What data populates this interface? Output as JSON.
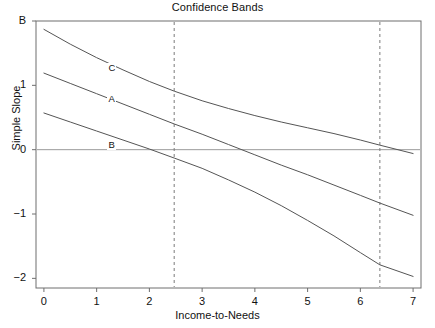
{
  "chart_data": {
    "type": "line",
    "title": "Confidence Bands",
    "xlabel": "Income-to-Needs",
    "ylabel": "Simple Slope",
    "xlim": [
      -0.15,
      7.15
    ],
    "ylim": [
      -2.15,
      2.0
    ],
    "grid": false,
    "legend": "inline-labels",
    "xticks": [
      0,
      1,
      2,
      3,
      4,
      5,
      6,
      7
    ],
    "xtick_labels": [
      "0",
      "1",
      "2",
      "3",
      "4",
      "5",
      "6",
      "7"
    ],
    "yticks": [
      2,
      1,
      0,
      -1,
      -2
    ],
    "ytick_labels": [
      "B",
      "1",
      "0",
      "−1",
      "−2"
    ],
    "zero_reference_line": 0,
    "vlines": [
      2.47,
      6.37
    ],
    "series": [
      {
        "name": "C",
        "role": "upper-confidence-band",
        "label": "C",
        "label_at": {
          "x": 1.28,
          "y": 1.27
        },
        "x": [
          0,
          0.5,
          1,
          1.5,
          2,
          2.47,
          3,
          3.5,
          4,
          4.5,
          5,
          5.5,
          6,
          6.37,
          7
        ],
        "y": [
          1.87,
          1.64,
          1.43,
          1.24,
          1.06,
          0.91,
          0.76,
          0.64,
          0.53,
          0.43,
          0.34,
          0.25,
          0.15,
          0.07,
          -0.06
        ]
      },
      {
        "name": "A",
        "role": "simple-slope-estimate",
        "label": "A",
        "label_at": {
          "x": 1.28,
          "y": 0.79
        },
        "x": [
          0,
          0.5,
          1,
          1.5,
          2,
          2.47,
          3,
          3.5,
          4,
          4.5,
          5,
          5.5,
          6,
          6.37,
          7
        ],
        "y": [
          1.19,
          1.03,
          0.87,
          0.71,
          0.55,
          0.4,
          0.24,
          0.08,
          -0.08,
          -0.24,
          -0.39,
          -0.55,
          -0.71,
          -0.83,
          -1.02
        ]
      },
      {
        "name": "B",
        "role": "lower-confidence-band",
        "label": "B",
        "label_at": {
          "x": 1.28,
          "y": 0.07
        },
        "x": [
          0,
          0.5,
          1,
          1.5,
          2,
          2.47,
          3,
          3.5,
          4,
          4.5,
          5,
          5.5,
          6,
          6.37,
          7
        ],
        "y": [
          0.57,
          0.43,
          0.29,
          0.15,
          0.01,
          -0.13,
          -0.29,
          -0.47,
          -0.66,
          -0.87,
          -1.1,
          -1.34,
          -1.6,
          -1.79,
          -1.97
        ]
      }
    ],
    "colors": {
      "curve": "#555555",
      "axis": "#6e6e6e",
      "zero_line": "#9a9a9a",
      "vline": "#7a7a7a",
      "text": "#111111",
      "background": "#ffffff"
    }
  }
}
